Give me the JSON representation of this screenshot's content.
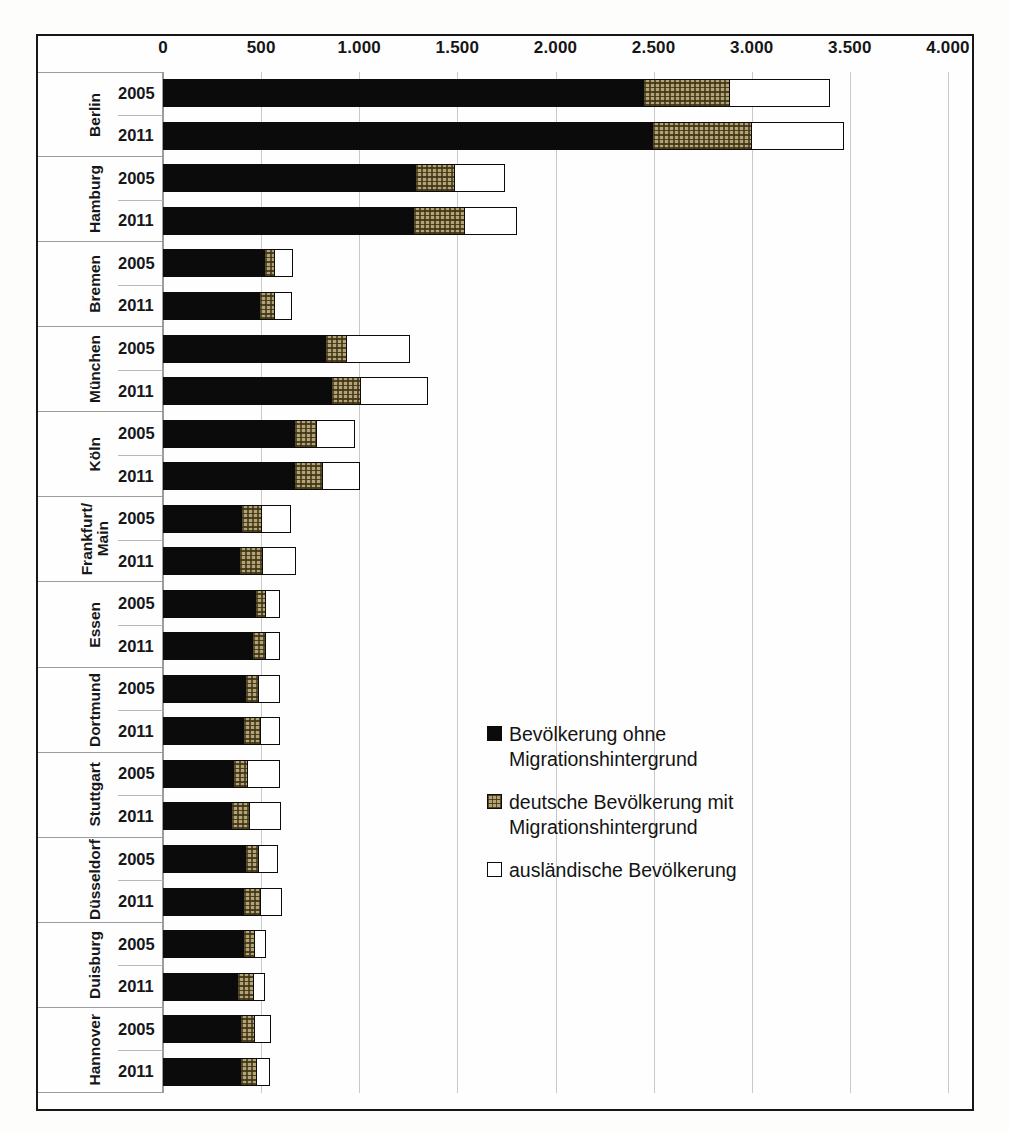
{
  "chart_data": {
    "type": "bar",
    "orientation": "horizontal",
    "stacked": true,
    "title": "",
    "xlabel": "",
    "ylabel": "",
    "xlim": [
      0,
      4000
    ],
    "xticks": [
      "0",
      "500",
      "1.000",
      "1.500",
      "2.000",
      "2.500",
      "3.000",
      "3.500",
      "4.000"
    ],
    "xtick_values": [
      0,
      500,
      1000,
      1500,
      2000,
      2500,
      3000,
      3500,
      4000
    ],
    "grid": true,
    "legend_position": "center-right",
    "series": [
      {
        "name": "Bevölkerung ohne\nMigrationshintergrund",
        "key": "ohne",
        "color": "#0b0b0b",
        "pattern": "solid-black"
      },
      {
        "name": "deutsche Bevölkerung mit\nMigrationshintergrund",
        "key": "deutsch_mit",
        "color": "#b3a375",
        "pattern": "crosshatch-tan"
      },
      {
        "name": "ausländische Bevölkerung",
        "key": "auslaendisch",
        "color": "#ffffff",
        "pattern": "outline-white"
      }
    ],
    "groups": [
      {
        "city": "Berlin",
        "rows": [
          {
            "year": "2005",
            "values": [
              2450,
              440,
              510
            ]
          },
          {
            "year": "2011",
            "values": [
              2495,
              505,
              470
            ]
          }
        ]
      },
      {
        "city": "Hamburg",
        "rows": [
          {
            "year": "2005",
            "values": [
              1290,
              200,
              255
            ]
          },
          {
            "year": "2011",
            "values": [
              1280,
              260,
              265
            ]
          }
        ]
      },
      {
        "city": "Bremen",
        "rows": [
          {
            "year": "2005",
            "values": [
              520,
              50,
              92
            ]
          },
          {
            "year": "2011",
            "values": [
              495,
              75,
              85
            ]
          }
        ]
      },
      {
        "city": "München",
        "rows": [
          {
            "year": "2005",
            "values": [
              830,
              107,
              320
            ]
          },
          {
            "year": "2011",
            "values": [
              860,
              148,
              341
            ]
          }
        ]
      },
      {
        "city": "Köln",
        "rows": [
          {
            "year": "2005",
            "values": [
              672,
              112,
              194
            ]
          },
          {
            "year": "2011",
            "values": [
              672,
              143,
              188
            ]
          }
        ]
      },
      {
        "city": "Frankfurt/\nMain",
        "rows": [
          {
            "year": "2005",
            "values": [
              402,
              102,
              148
            ]
          },
          {
            "year": "2011",
            "values": [
              392,
              117,
              168
            ]
          }
        ]
      },
      {
        "city": "Essen",
        "rows": [
          {
            "year": "2005",
            "values": [
              474,
              51,
              71
            ]
          },
          {
            "year": "2011",
            "values": [
              459,
              66,
              71
            ]
          }
        ]
      },
      {
        "city": "Dortmund",
        "rows": [
          {
            "year": "2005",
            "values": [
              423,
              66,
              107
            ]
          },
          {
            "year": "2011",
            "values": [
              413,
              87,
              97
            ]
          }
        ]
      },
      {
        "city": "Stuttgart",
        "rows": [
          {
            "year": "2005",
            "values": [
              362,
              71,
              163
            ]
          },
          {
            "year": "2011",
            "values": [
              352,
              92,
              158
            ]
          }
        ]
      },
      {
        "city": "Düsseldorf",
        "rows": [
          {
            "year": "2005",
            "values": [
              423,
              66,
              97
            ]
          },
          {
            "year": "2011",
            "values": [
              413,
              87,
              107
            ]
          }
        ]
      },
      {
        "city": "Duisburg",
        "rows": [
          {
            "year": "2005",
            "values": [
              413,
              56,
              56
            ]
          },
          {
            "year": "2011",
            "values": [
              382,
              82,
              56
            ]
          }
        ]
      },
      {
        "city": "Hannover",
        "rows": [
          {
            "year": "2005",
            "values": [
              398,
              71,
              82
            ]
          },
          {
            "year": "2011",
            "values": [
              398,
              82,
              66
            ]
          }
        ]
      }
    ]
  },
  "legend": {
    "items": [
      {
        "label": "Bevölkerung ohne\nMigrationshintergrund",
        "swatch": "k"
      },
      {
        "label": "deutsche Bevölkerung mit\nMigrationshintergrund",
        "swatch": "p"
      },
      {
        "label": "ausländische Bevölkerung",
        "swatch": "w"
      }
    ]
  }
}
